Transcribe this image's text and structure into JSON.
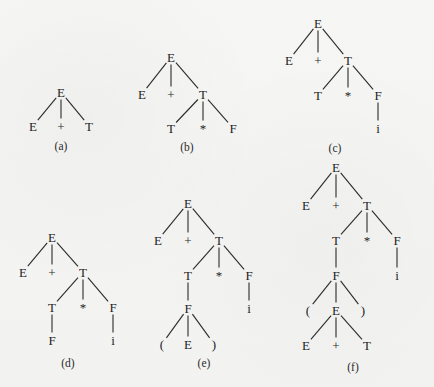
{
  "figure": {
    "trees": [
      {
        "id": "a",
        "caption": "(a)",
        "nodes": [
          {
            "id": "n1",
            "label": "E"
          },
          {
            "id": "n2",
            "label": "E",
            "parent": "n1"
          },
          {
            "id": "n3",
            "label": "+",
            "parent": "n1"
          },
          {
            "id": "n4",
            "label": "T",
            "parent": "n1"
          }
        ]
      },
      {
        "id": "b",
        "caption": "(b)",
        "nodes": [
          {
            "id": "n1",
            "label": "E"
          },
          {
            "id": "n2",
            "label": "E",
            "parent": "n1"
          },
          {
            "id": "n3",
            "label": "+",
            "parent": "n1"
          },
          {
            "id": "n4",
            "label": "T",
            "parent": "n1"
          },
          {
            "id": "n5",
            "label": "T",
            "parent": "n4"
          },
          {
            "id": "n6",
            "label": "*",
            "parent": "n4"
          },
          {
            "id": "n7",
            "label": "F",
            "parent": "n4"
          }
        ]
      },
      {
        "id": "c",
        "caption": "(c)",
        "nodes": [
          {
            "id": "n1",
            "label": "E"
          },
          {
            "id": "n2",
            "label": "E",
            "parent": "n1"
          },
          {
            "id": "n3",
            "label": "+",
            "parent": "n1"
          },
          {
            "id": "n4",
            "label": "T",
            "parent": "n1"
          },
          {
            "id": "n5",
            "label": "T",
            "parent": "n4"
          },
          {
            "id": "n6",
            "label": "*",
            "parent": "n4"
          },
          {
            "id": "n7",
            "label": "F",
            "parent": "n4"
          },
          {
            "id": "n8",
            "label": "i",
            "parent": "n7"
          }
        ]
      },
      {
        "id": "d",
        "caption": "(d)",
        "nodes": [
          {
            "id": "n1",
            "label": "E"
          },
          {
            "id": "n2",
            "label": "E",
            "parent": "n1"
          },
          {
            "id": "n3",
            "label": "+",
            "parent": "n1"
          },
          {
            "id": "n4",
            "label": "T",
            "parent": "n1"
          },
          {
            "id": "n5",
            "label": "T",
            "parent": "n4"
          },
          {
            "id": "n6",
            "label": "*",
            "parent": "n4"
          },
          {
            "id": "n7",
            "label": "F",
            "parent": "n4"
          },
          {
            "id": "n8",
            "label": "F",
            "parent": "n5"
          },
          {
            "id": "n9",
            "label": "i",
            "parent": "n7"
          }
        ]
      },
      {
        "id": "e",
        "caption": "(e)",
        "nodes": [
          {
            "id": "n1",
            "label": "E"
          },
          {
            "id": "n2",
            "label": "E",
            "parent": "n1"
          },
          {
            "id": "n3",
            "label": "+",
            "parent": "n1"
          },
          {
            "id": "n4",
            "label": "T",
            "parent": "n1"
          },
          {
            "id": "n5",
            "label": "T",
            "parent": "n4"
          },
          {
            "id": "n6",
            "label": "*",
            "parent": "n4"
          },
          {
            "id": "n7",
            "label": "F",
            "parent": "n4"
          },
          {
            "id": "n8",
            "label": "F",
            "parent": "n5"
          },
          {
            "id": "n9",
            "label": "i",
            "parent": "n7"
          },
          {
            "id": "n10",
            "label": "(",
            "parent": "n8"
          },
          {
            "id": "n11",
            "label": "E",
            "parent": "n8"
          },
          {
            "id": "n12",
            "label": ")",
            "parent": "n8"
          }
        ]
      },
      {
        "id": "f",
        "caption": "(f)",
        "nodes": [
          {
            "id": "n1",
            "label": "E"
          },
          {
            "id": "n2",
            "label": "E",
            "parent": "n1"
          },
          {
            "id": "n3",
            "label": "+",
            "parent": "n1"
          },
          {
            "id": "n4",
            "label": "T",
            "parent": "n1"
          },
          {
            "id": "n5",
            "label": "T",
            "parent": "n4"
          },
          {
            "id": "n6",
            "label": "*",
            "parent": "n4"
          },
          {
            "id": "n7",
            "label": "F",
            "parent": "n4"
          },
          {
            "id": "n8",
            "label": "F",
            "parent": "n5"
          },
          {
            "id": "n9",
            "label": "i",
            "parent": "n7"
          },
          {
            "id": "n10",
            "label": "(",
            "parent": "n8"
          },
          {
            "id": "n11",
            "label": "E",
            "parent": "n8"
          },
          {
            "id": "n12",
            "label": ")",
            "parent": "n8"
          },
          {
            "id": "n13",
            "label": "E",
            "parent": "n11"
          },
          {
            "id": "n14",
            "label": "+",
            "parent": "n11"
          },
          {
            "id": "n15",
            "label": "T",
            "parent": "n11"
          }
        ]
      }
    ]
  }
}
